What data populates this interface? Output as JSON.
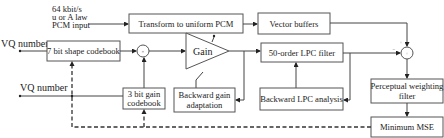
{
  "diagram": {
    "input_label": [
      "64 kbit/s",
      "u or A law",
      "PCM input"
    ],
    "blocks": {
      "transform": "Transform to uniform PCM",
      "vector_buffers": "Vector buffers",
      "shape_codebook": "7 bit shape codebook",
      "gain": "Gain",
      "lpc_filter": "50-order LPC filter",
      "gain_codebook": [
        "3 bit gain",
        "codebook"
      ],
      "backward_gain": [
        "Backward gain",
        "adaptation"
      ],
      "backward_lpc": "Backward LPC analysis",
      "perceptual": [
        "Perceptual weighting",
        "filter"
      ],
      "min_mse": "Minimum MSE"
    },
    "outputs": {
      "vq_shape": "VQ number",
      "vq_gain": "VQ number"
    },
    "signs": {
      "multiplier": "×",
      "adder": "+",
      "plus": "+",
      "minus": "−"
    },
    "colors": {
      "line": "#444444",
      "box_stroke": "#555555",
      "text": "#222222"
    }
  }
}
